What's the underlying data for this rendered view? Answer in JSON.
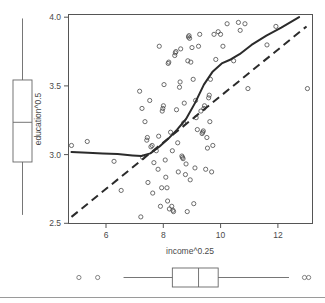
{
  "chart_data": {
    "type": "scatter",
    "title": "",
    "xlabel": "income^0.25",
    "ylabel": "education^0.5",
    "xlim": [
      4.85,
      13.05
    ],
    "ylim": [
      2.47,
      4.05
    ],
    "xticks": [
      6,
      8,
      10,
      12
    ],
    "xtick_labels": [
      "6",
      "8",
      "10",
      "12"
    ],
    "yticks": [
      2.5,
      3.0,
      3.5,
      4.0
    ],
    "ytick_labels": [
      "2.5",
      "3.0",
      "3.5",
      "4.0"
    ],
    "grid": false,
    "legend": "none",
    "marker": "open-circle",
    "points": [
      [
        4.95,
        3.06
      ],
      [
        5.48,
        3.09
      ],
      [
        6.38,
        2.94
      ],
      [
        6.62,
        2.72
      ],
      [
        7.24,
        3.47
      ],
      [
        7.28,
        2.52
      ],
      [
        7.32,
        3.34
      ],
      [
        7.34,
        2.97
      ],
      [
        7.42,
        3.24
      ],
      [
        7.48,
        3.1
      ],
      [
        7.5,
        3.12
      ],
      [
        7.52,
        2.78
      ],
      [
        7.58,
        3.4
      ],
      [
        7.62,
        3.05
      ],
      [
        7.66,
        3.06
      ],
      [
        7.68,
        2.7
      ],
      [
        7.72,
        2.93
      ],
      [
        7.8,
        3.02
      ],
      [
        7.86,
        2.88
      ],
      [
        7.9,
        3.81
      ],
      [
        7.94,
        2.6
      ],
      [
        7.98,
        2.74
      ],
      [
        8.0,
        3.32
      ],
      [
        8.02,
        3.34
      ],
      [
        8.04,
        3.36
      ],
      [
        8.06,
        3.52
      ],
      [
        8.1,
        2.95
      ],
      [
        8.12,
        2.82
      ],
      [
        8.16,
        2.74
      ],
      [
        8.18,
        2.64
      ],
      [
        8.2,
        3.68
      ],
      [
        8.22,
        3.69
      ],
      [
        8.24,
        2.58
      ],
      [
        8.28,
        3.16
      ],
      [
        8.32,
        2.6
      ],
      [
        8.36,
        2.57
      ],
      [
        8.38,
        2.56
      ],
      [
        8.42,
        3.74
      ],
      [
        8.44,
        3.76
      ],
      [
        8.46,
        3.77
      ],
      [
        8.48,
        3.33
      ],
      [
        8.52,
        3.08
      ],
      [
        8.54,
        2.86
      ],
      [
        8.58,
        3.5
      ],
      [
        8.6,
        3.54
      ],
      [
        8.62,
        3.79
      ],
      [
        8.66,
        2.98
      ],
      [
        8.68,
        2.97
      ],
      [
        8.7,
        2.96
      ],
      [
        8.72,
        3.23
      ],
      [
        8.74,
        3.38
      ],
      [
        8.78,
        2.84
      ],
      [
        8.8,
        2.92
      ],
      [
        8.84,
        2.56
      ],
      [
        8.88,
        3.88
      ],
      [
        8.9,
        3.89
      ],
      [
        8.92,
        3.87
      ],
      [
        8.96,
        3.69
      ],
      [
        9.0,
        3.8
      ],
      [
        9.04,
        3.56
      ],
      [
        9.06,
        2.62
      ],
      [
        9.1,
        2.89
      ],
      [
        9.14,
        3.27
      ],
      [
        9.18,
        3.18
      ],
      [
        9.22,
        3.81
      ],
      [
        9.26,
        3.9
      ],
      [
        9.3,
        3.32
      ],
      [
        9.34,
        3.15
      ],
      [
        9.36,
        3.16
      ],
      [
        9.38,
        3.17
      ],
      [
        9.4,
        3.34
      ],
      [
        9.42,
        3.36
      ],
      [
        9.46,
        2.88
      ],
      [
        9.5,
        3.12
      ],
      [
        9.52,
        3.04
      ],
      [
        9.56,
        3.42
      ],
      [
        9.58,
        3.44
      ],
      [
        9.62,
        3.56
      ],
      [
        9.66,
        2.86
      ],
      [
        9.7,
        3.06
      ],
      [
        9.74,
        3.9
      ],
      [
        9.8,
        3.71
      ],
      [
        9.88,
        3.92
      ],
      [
        9.96,
        3.9
      ],
      [
        10.04,
        3.81
      ],
      [
        10.18,
        3.98
      ],
      [
        10.4,
        3.7
      ],
      [
        10.56,
        3.99
      ],
      [
        10.62,
        3.93
      ],
      [
        10.78,
        3.98
      ],
      [
        10.88,
        3.49
      ],
      [
        11.52,
        3.82
      ],
      [
        11.82,
        3.96
      ],
      [
        12.88,
        3.49
      ],
      [
        8.86,
        3.7
      ],
      [
        9.12,
        3.4
      ],
      [
        8.34,
        3.02
      ],
      [
        8.94,
        2.8
      ],
      [
        9.6,
        3.24
      ],
      [
        7.88,
        3.13
      ]
    ],
    "loess_curve": [
      [
        4.95,
        3.01
      ],
      [
        5.5,
        3.005
      ],
      [
        6.0,
        3.0
      ],
      [
        6.5,
        2.995
      ],
      [
        7.0,
        2.985
      ],
      [
        7.3,
        2.98
      ],
      [
        7.6,
        3.0
      ],
      [
        7.9,
        3.05
      ],
      [
        8.2,
        3.11
      ],
      [
        8.5,
        3.18
      ],
      [
        8.8,
        3.26
      ],
      [
        9.1,
        3.38
      ],
      [
        9.4,
        3.52
      ],
      [
        9.7,
        3.62
      ],
      [
        10.0,
        3.68
      ],
      [
        10.3,
        3.71
      ],
      [
        10.6,
        3.75
      ],
      [
        11.0,
        3.82
      ],
      [
        11.5,
        3.89
      ],
      [
        12.0,
        3.95
      ],
      [
        12.6,
        4.03
      ]
    ],
    "fit_line": {
      "x0": 4.95,
      "y0": 2.52,
      "x1": 12.85,
      "y1": 3.96
    },
    "series_notes": {
      "solid_line": "loess smoother",
      "dashed_line": "least-squares fit"
    }
  },
  "marginal_boxplots": {
    "y_boxplot": {
      "orientation": "vertical",
      "whisker_low": 2.535,
      "q1": 2.935,
      "median": 3.235,
      "q3": 3.555,
      "whisker_high": 4.02,
      "outliers": []
    },
    "x_boxplot": {
      "orientation": "horizontal",
      "whisker_low": 6.7,
      "q1": 8.34,
      "median": 9.22,
      "q3": 9.88,
      "whisker_high": 12.26,
      "outliers": [
        5.2,
        5.83,
        12.78,
        12.92
      ]
    }
  },
  "axes": {
    "x_title": "income^0.25",
    "y_title": "education^0.5"
  }
}
